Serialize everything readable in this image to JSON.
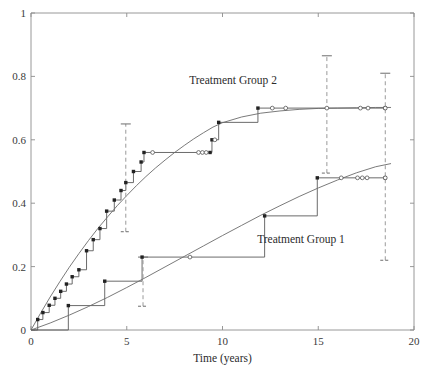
{
  "chart_data": {
    "type": "line",
    "title": "",
    "xlabel": "Time (years)",
    "ylabel": "",
    "xlim": [
      0,
      20
    ],
    "ylim": [
      0,
      1
    ],
    "grid": false,
    "legend_position": "inline-annotations",
    "xticks": [
      0,
      5,
      10,
      15,
      20
    ],
    "xticklabels": [
      "0",
      "5",
      "10",
      "15",
      "20"
    ],
    "yticks": [
      0,
      0.2,
      0.4,
      0.6,
      0.8,
      1
    ],
    "yticklabels": [
      "0",
      "0.2",
      "0.4",
      "0.6",
      "0.8",
      "1"
    ],
    "annotations": [
      {
        "text": "Treatment Group 2",
        "x": 10.55,
        "y": 0.775
      },
      {
        "text": "Treatment Group 1",
        "x": 14.1,
        "y": 0.275
      }
    ],
    "series": [
      {
        "name": "Treatment Group 2",
        "style": "step-post",
        "marker": "filled-square",
        "x": [
          0.0,
          0.35,
          0.62,
          0.95,
          1.25,
          1.55,
          1.85,
          2.15,
          2.5,
          2.9,
          3.25,
          3.6,
          3.95,
          4.35,
          4.7,
          4.95,
          5.35,
          5.75,
          5.9,
          9.35,
          9.45,
          9.8,
          11.85,
          18.5
        ],
        "y": [
          0.0,
          0.033,
          0.055,
          0.078,
          0.1,
          0.122,
          0.145,
          0.168,
          0.19,
          0.25,
          0.285,
          0.32,
          0.375,
          0.41,
          0.44,
          0.465,
          0.5,
          0.53,
          0.56,
          0.56,
          0.6,
          0.655,
          0.7,
          0.7
        ]
      },
      {
        "name": "Treatment Group 2 (smooth model fit)",
        "style": "smooth",
        "marker": "none",
        "x": [
          0.0,
          0.5,
          1.0,
          1.5,
          2.0,
          2.5,
          3.0,
          3.5,
          4.0,
          4.5,
          5.0,
          5.5,
          6.0,
          6.5,
          7.0,
          7.5,
          8.0,
          8.5,
          9.0,
          9.5,
          10.0,
          11.0,
          12.0,
          13.0,
          14.0,
          15.0,
          16.0,
          17.0,
          18.0,
          18.8
        ],
        "y": [
          0.0,
          0.053,
          0.104,
          0.152,
          0.198,
          0.241,
          0.282,
          0.321,
          0.357,
          0.392,
          0.424,
          0.455,
          0.484,
          0.511,
          0.536,
          0.56,
          0.582,
          0.603,
          0.622,
          0.64,
          0.654,
          0.672,
          0.684,
          0.691,
          0.696,
          0.699,
          0.7,
          0.701,
          0.702,
          0.702
        ]
      },
      {
        "name": "Treatment Group 1",
        "style": "step-post",
        "marker": "filled-square",
        "x": [
          0.0,
          1.95,
          3.85,
          5.8,
          12.2,
          14.95,
          18.5
        ],
        "y": [
          0.0,
          0.077,
          0.154,
          0.23,
          0.36,
          0.48,
          0.48
        ]
      },
      {
        "name": "Treatment Group 1 (smooth model fit)",
        "style": "smooth",
        "marker": "none",
        "x": [
          0.0,
          1.0,
          2.0,
          3.0,
          4.0,
          5.0,
          6.0,
          7.0,
          8.0,
          9.0,
          10.0,
          11.0,
          12.0,
          13.0,
          14.0,
          15.0,
          16.0,
          17.0,
          18.0,
          18.8
        ],
        "y": [
          0.0,
          0.022,
          0.047,
          0.074,
          0.103,
          0.134,
          0.166,
          0.199,
          0.232,
          0.265,
          0.298,
          0.33,
          0.362,
          0.392,
          0.421,
          0.448,
          0.473,
          0.496,
          0.515,
          0.525
        ]
      }
    ],
    "censoring_marks": [
      {
        "series": "Treatment Group 2",
        "x": 6.35,
        "y": 0.56
      },
      {
        "series": "Treatment Group 2",
        "x": 8.75,
        "y": 0.56
      },
      {
        "series": "Treatment Group 2",
        "x": 8.95,
        "y": 0.56
      },
      {
        "series": "Treatment Group 2",
        "x": 9.15,
        "y": 0.56
      },
      {
        "series": "Treatment Group 2",
        "x": 9.6,
        "y": 0.6
      },
      {
        "series": "Treatment Group 2",
        "x": 12.6,
        "y": 0.7
      },
      {
        "series": "Treatment Group 2",
        "x": 13.3,
        "y": 0.7
      },
      {
        "series": "Treatment Group 2",
        "x": 15.45,
        "y": 0.7
      },
      {
        "series": "Treatment Group 2",
        "x": 17.2,
        "y": 0.7
      },
      {
        "series": "Treatment Group 2",
        "x": 17.6,
        "y": 0.7
      },
      {
        "series": "Treatment Group 2",
        "x": 18.5,
        "y": 0.7
      },
      {
        "series": "Treatment Group 1",
        "x": 8.3,
        "y": 0.23
      },
      {
        "series": "Treatment Group 1",
        "x": 16.2,
        "y": 0.48
      },
      {
        "series": "Treatment Group 1",
        "x": 17.05,
        "y": 0.48
      },
      {
        "series": "Treatment Group 1",
        "x": 17.3,
        "y": 0.48
      },
      {
        "series": "Treatment Group 1",
        "x": 17.55,
        "y": 0.48
      },
      {
        "series": "Treatment Group 1",
        "x": 18.5,
        "y": 0.48
      }
    ],
    "error_bars": [
      {
        "series": "Treatment Group 2",
        "x": 4.95,
        "low": 0.31,
        "high": 0.65
      },
      {
        "series": "Treatment Group 2",
        "x": 15.45,
        "low": 0.495,
        "high": 0.865
      },
      {
        "series": "Treatment Group 1",
        "x": 5.85,
        "low": 0.075,
        "high": 0.23
      },
      {
        "series": "Treatment Group 1",
        "x": 18.5,
        "low": 0.22,
        "high": 0.81
      }
    ],
    "colors": {
      "axis": "#8c8c8c",
      "step": "#5a5a5a",
      "smooth": "#6b6b6b",
      "marker": "#222222",
      "censor": "#555555",
      "errorbar": "#9a9a9a",
      "text": "#2b2b2b",
      "background": "#ffffff"
    }
  }
}
